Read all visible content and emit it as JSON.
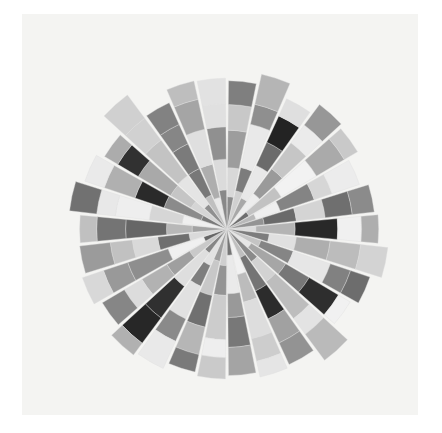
{
  "figure": {
    "background_color": "#ffffff",
    "axes_background_color": "#f4f4f2",
    "axes_rect": {
      "x": 22,
      "y": 14,
      "width": 396,
      "height": 401
    }
  },
  "chart_data": {
    "type": "bar",
    "title": "",
    "subtitle": "",
    "xlabel": "",
    "ylabel": "",
    "grid": false,
    "legend_position": "none",
    "projection": "polar",
    "style": "stacked-radial-rose",
    "center": {
      "x": 227,
      "y": 229
    },
    "max_radius": 196,
    "sector_count": 30,
    "segments_per_sector": 5,
    "sector_gap_deg": 1.2,
    "theta_start_deg": -90,
    "edge_color": "#dedede",
    "edge_width": 0.4,
    "categories": [
      "s01",
      "s02",
      "s03",
      "s04",
      "s05",
      "s06",
      "s07",
      "s08",
      "s09",
      "s10",
      "s11",
      "s12",
      "s13",
      "s14",
      "s15",
      "s16",
      "s17",
      "s18",
      "s19",
      "s20",
      "s21",
      "s22",
      "s23",
      "s24",
      "s25",
      "s26",
      "s27",
      "s28",
      "s29",
      "s30"
    ],
    "series": [
      {
        "name": "layer-1",
        "values": [
          38,
          46,
          40,
          52,
          30,
          36,
          44,
          34,
          50,
          42,
          33,
          48,
          37,
          55,
          31,
          43,
          39,
          47,
          35,
          51,
          29,
          45,
          41,
          53,
          32,
          49,
          36,
          44,
          38,
          46
        ],
        "colors": [
          "#8c8c8c",
          "#d0d0d0",
          "#a8a8a8",
          "#ededed",
          "#6e6e6e",
          "#b9b9b9",
          "#949494",
          "#dcdcdc",
          "#7d7d7d",
          "#c4c4c4",
          "#e6e6e6",
          "#8a8a8a",
          "#bfbfbf",
          "#f1f1f1",
          "#757575",
          "#cfcfcf",
          "#9e9e9e",
          "#e2e2e2",
          "#868686",
          "#c9c9c9",
          "#666666",
          "#dadada",
          "#a2a2a2",
          "#efefef",
          "#7a7a7a",
          "#d5d5d5",
          "#909090",
          "#c0c0c0",
          "#e9e9e9",
          "#888888"
        ]
      },
      {
        "name": "layer-2",
        "values": [
          34,
          28,
          42,
          36,
          44,
          30,
          38,
          46,
          32,
          40,
          47,
          29,
          43,
          33,
          45,
          35,
          41,
          27,
          49,
          31,
          44,
          37,
          30,
          39,
          46,
          28,
          42,
          34,
          40,
          36
        ],
        "colors": [
          "#d8d8d8",
          "#7c7c7c",
          "#e8e8e8",
          "#9a9a9a",
          "#c2c2c2",
          "#efefef",
          "#6a6a6a",
          "#b4b4b4",
          "#e0e0e0",
          "#858585",
          "#a6a6a6",
          "#d2d2d2",
          "#747474",
          "#bcbcbc",
          "#eaeaea",
          "#949494",
          "#c8c8c8",
          "#7e7e7e",
          "#dedede",
          "#9f9f9f",
          "#f0f0f0",
          "#6f6f6f",
          "#b8b8b8",
          "#d6d6d6",
          "#8b8b8b",
          "#c5c5c5",
          "#e4e4e4",
          "#787878",
          "#aeaeae",
          "#dbdbdb"
        ]
      },
      {
        "name": "layer-3",
        "values": [
          44,
          52,
          30,
          38,
          48,
          42,
          34,
          50,
          40,
          46,
          32,
          54,
          36,
          44,
          28,
          52,
          38,
          42,
          46,
          34,
          50,
          30,
          48,
          40,
          36,
          44,
          52,
          32,
          42,
          38
        ],
        "colors": [
          "#9d9d9d",
          "#e9e9e9",
          "#6b6b6b",
          "#c6c6c6",
          "#f2f2f2",
          "#848484",
          "#d4d4d4",
          "#282828",
          "#aeaeae",
          "#e6e6e6",
          "#777777",
          "#bdbdbd",
          "#2c2c2c",
          "#dddddd",
          "#999999",
          "#cccccc",
          "#707070",
          "#e1e1e1",
          "#303030",
          "#b2b2b2",
          "#8e8e8e",
          "#d9d9d9",
          "#666666",
          "#eeeeee",
          "#2a2a2a",
          "#a9a9a9",
          "#c3c3c3",
          "#7b7b7b",
          "#dfdfdf",
          "#909090"
        ]
      },
      {
        "name": "layer-4",
        "values": [
          30,
          24,
          34,
          26,
          38,
          22,
          32,
          28,
          36,
          25,
          40,
          23,
          31,
          27,
          35,
          21,
          33,
          29,
          37,
          24,
          30,
          26,
          34,
          22,
          38,
          28,
          32,
          25,
          36,
          27
        ],
        "colors": [
          "#c8c8c8",
          "#8f8f8f",
          "#232323",
          "#ebebeb",
          "#aaaaaa",
          "#d6d6d6",
          "#6f6f6f",
          "#f0f0f0",
          "#bcbcbc",
          "#818181",
          "#2e2e2e",
          "#e3e3e3",
          "#a1a1a1",
          "#cdcdcd",
          "#787878",
          "#eeeeee",
          "#b6b6b6",
          "#8a8a8a",
          "#272727",
          "#dcdcdc",
          "#999999",
          "#c1c1c1",
          "#747474",
          "#e8e8e8",
          "#b0b0b0",
          "#313131",
          "#d1d1d1",
          "#868686",
          "#a5a5a5",
          "#e0e0e0"
        ]
      },
      {
        "name": "layer-5",
        "values": [
          28,
          36,
          22,
          30,
          18,
          34,
          26,
          20,
          32,
          24,
          16,
          38,
          28,
          19,
          33,
          25,
          21,
          35,
          17,
          30,
          26,
          36,
          20,
          32,
          24,
          18,
          34,
          28,
          22,
          30
        ],
        "colors": [
          "#7f7f7f",
          "#b5b5b5",
          "#dfdfdf",
          "#979797",
          "#c9c9c9",
          "#ececec",
          "#8b8b8b",
          "#aeaeae",
          "#d3d3d3",
          "#6d6d6d",
          "#f1f1f1",
          "#bababa",
          "#939393",
          "#e5e5e5",
          "#a4a4a4",
          "#cacaca",
          "#7a7a7a",
          "#e9e9e9",
          "#b1b1b1",
          "#868686",
          "#d8d8d8",
          "#9b9b9b",
          "#c0c0c0",
          "#717171",
          "#eaeaea",
          "#acacac",
          "#d0d0d0",
          "#828282",
          "#bebebe",
          "#e2e2e2"
        ]
      }
    ],
    "radial_axis_range": [
      0,
      230
    ],
    "angular_tick_labels": [],
    "radial_tick_labels": []
  }
}
